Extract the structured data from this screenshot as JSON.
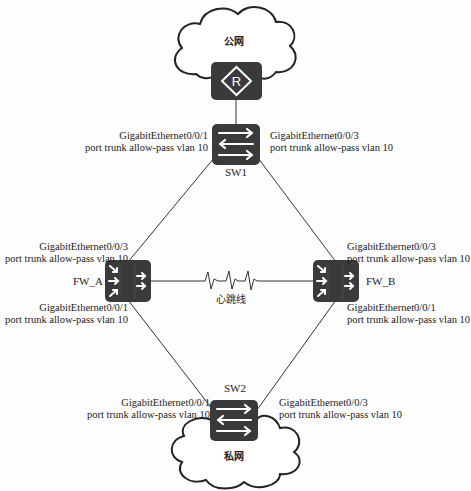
{
  "clouds": {
    "public": {
      "label": "公网"
    },
    "private": {
      "label": "私网"
    }
  },
  "devices": {
    "router": {
      "icon": "router-icon",
      "glyph": "R"
    },
    "sw1": {
      "name": "SW1"
    },
    "sw2": {
      "name": "SW2"
    },
    "fw_a": {
      "name": "FW_A"
    },
    "fw_b": {
      "name": "FW_B"
    }
  },
  "heartbeat": {
    "label": "心跳线"
  },
  "ports": {
    "sw1_left": {
      "iface": "GigabitEthernet0/0/1",
      "config": "port trunk allow-pass vlan 10"
    },
    "sw1_right": {
      "iface": "GigabitEthernet0/0/3",
      "config": "port trunk allow-pass vlan 10"
    },
    "fwa_top": {
      "iface": "GigabitEthernet0/0/3",
      "config": "port trunk allow-pass vlan 10"
    },
    "fwa_bottom": {
      "iface": "GigabitEthernet0/0/1",
      "config": "port trunk allow-pass vlan 10"
    },
    "fwb_top": {
      "iface": "GigabitEthernet0/0/3",
      "config": "port trunk allow-pass vlan 10"
    },
    "fwb_bottom": {
      "iface": "GigabitEthernet0/0/1",
      "config": "port trunk allow-pass vlan 10"
    },
    "sw2_left": {
      "iface": "GigabitEthernet0/0/1",
      "config": "port trunk allow-pass vlan 10"
    },
    "sw2_right": {
      "iface": "GigabitEthernet0/0/3",
      "config": "port trunk allow-pass vlan 10"
    }
  },
  "colors": {
    "device_fill": "#3a3a3a",
    "line": "#333333",
    "cloud_stroke": "#222222"
  }
}
